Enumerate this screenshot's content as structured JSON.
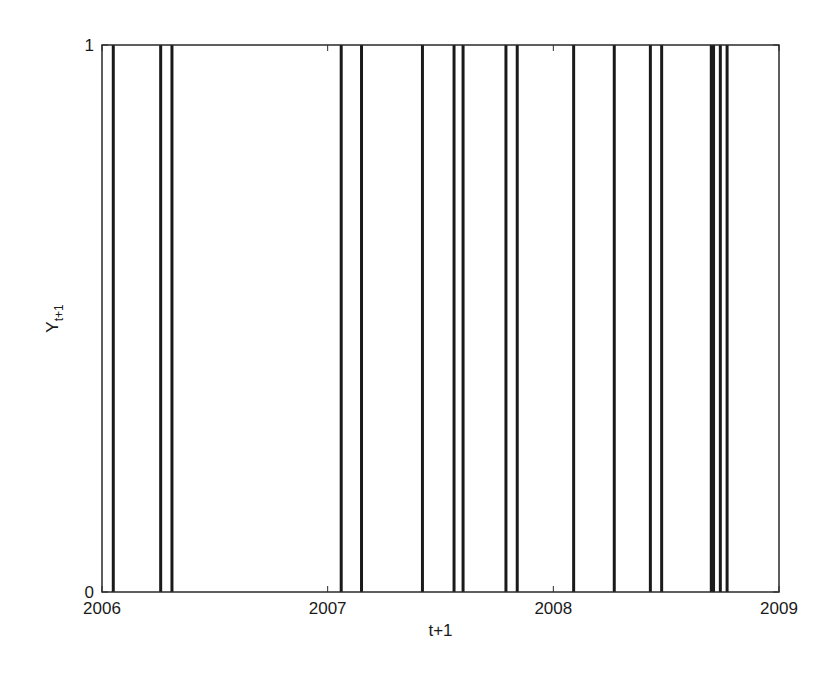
{
  "chart_data": {
    "type": "bar",
    "subtype": "event-spike",
    "title": "",
    "xlabel": "t+1",
    "ylabel": "Y",
    "ylabel_subscript": "t+1",
    "xlim": [
      2006,
      2009
    ],
    "ylim": [
      0,
      1
    ],
    "xticks": [
      2006,
      2007,
      2008,
      2009
    ],
    "xtick_labels": [
      "2006",
      "2007",
      "2008",
      "2009"
    ],
    "yticks": [
      0,
      1
    ],
    "ytick_labels": [
      "0",
      "1"
    ],
    "grid": false,
    "legend": null,
    "series": [
      {
        "name": "Y_{t+1}",
        "description": "Binary indicator; vertical lines mark times where Y_{t+1} = 1",
        "x": [
          2006.05,
          2006.26,
          2006.31,
          2007.06,
          2007.15,
          2007.42,
          2007.56,
          2007.6,
          2007.79,
          2007.84,
          2008.09,
          2008.27,
          2008.43,
          2008.48,
          2008.7,
          2008.71,
          2008.74,
          2008.77
        ],
        "values": [
          1,
          1,
          1,
          1,
          1,
          1,
          1,
          1,
          1,
          1,
          1,
          1,
          1,
          1,
          1,
          1,
          1,
          1
        ]
      }
    ],
    "colors": {
      "line": "#1a1a1a",
      "axis": "#2a2a2a",
      "background": "#ffffff"
    }
  }
}
